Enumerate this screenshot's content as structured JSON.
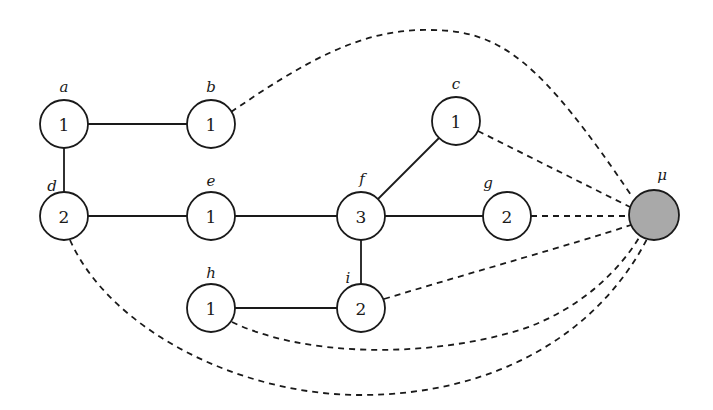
{
  "diagram": {
    "node_radius": 24,
    "colors": {
      "node_fill": "#ffffff",
      "sink_fill": "#a9a9a9",
      "stroke": "#1a1a1a"
    },
    "nodes": [
      {
        "id": "a",
        "label": "a",
        "value": "1",
        "cx": 64,
        "cy": 124,
        "lx": 64,
        "ly": 92,
        "fill": "#ffffff"
      },
      {
        "id": "b",
        "label": "b",
        "value": "1",
        "cx": 211,
        "cy": 124,
        "lx": 211,
        "ly": 92,
        "fill": "#ffffff"
      },
      {
        "id": "c",
        "label": "c",
        "value": "1",
        "cx": 456,
        "cy": 121,
        "lx": 456,
        "ly": 89,
        "fill": "#ffffff"
      },
      {
        "id": "d",
        "label": "d",
        "value": "2",
        "cx": 64,
        "cy": 216,
        "lx": 52,
        "ly": 191,
        "fill": "#ffffff"
      },
      {
        "id": "e",
        "label": "e",
        "value": "1",
        "cx": 211,
        "cy": 216,
        "lx": 211,
        "ly": 186,
        "fill": "#ffffff"
      },
      {
        "id": "f",
        "label": "f",
        "value": "3",
        "cx": 361,
        "cy": 216,
        "lx": 362,
        "ly": 184,
        "fill": "#ffffff"
      },
      {
        "id": "g",
        "label": "g",
        "value": "2",
        "cx": 507,
        "cy": 216,
        "lx": 488,
        "ly": 188,
        "fill": "#ffffff"
      },
      {
        "id": "h",
        "label": "h",
        "value": "1",
        "cx": 211,
        "cy": 308,
        "lx": 211,
        "ly": 278,
        "fill": "#ffffff"
      },
      {
        "id": "i",
        "label": "i",
        "value": "2",
        "cx": 361,
        "cy": 308,
        "lx": 348,
        "ly": 283,
        "fill": "#ffffff"
      },
      {
        "id": "mu",
        "label": "μ",
        "value": "",
        "cx": 654,
        "cy": 215,
        "lx": 662,
        "ly": 180,
        "fill": "#a9a9a9",
        "r": 25
      }
    ],
    "solid_edges": [
      {
        "from": "a",
        "to": "b"
      },
      {
        "from": "a",
        "to": "d"
      },
      {
        "from": "d",
        "to": "e"
      },
      {
        "from": "e",
        "to": "f"
      },
      {
        "from": "f",
        "to": "c"
      },
      {
        "from": "f",
        "to": "g"
      },
      {
        "from": "f",
        "to": "i"
      },
      {
        "from": "h",
        "to": "i"
      }
    ],
    "dashed_edges": [
      {
        "from": "b",
        "to": "mu",
        "path": "M 231 112 C 300 65, 360 28, 430 30 C 500 30, 540 60, 633 198"
      },
      {
        "from": "c",
        "to": "mu",
        "path": "M 478 131 L 630 207"
      },
      {
        "from": "g",
        "to": "mu",
        "path": "M 531 216 L 629 216"
      },
      {
        "from": "i",
        "to": "mu",
        "path": "M 384 299 C 480 270, 570 245, 631 225"
      },
      {
        "from": "h",
        "to": "mu",
        "path": "M 232 322 C 300 355, 420 360, 520 330 C 580 310, 620 270, 640 236"
      },
      {
        "from": "d",
        "to": "mu",
        "path": "M 70 240 C 110 330, 240 395, 360 395 C 500 395, 600 330, 647 239"
      }
    ]
  }
}
